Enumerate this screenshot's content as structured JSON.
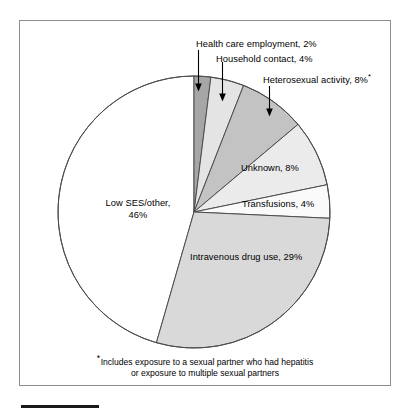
{
  "figure": {
    "frame_color": "#8d8d8d",
    "background": "#ffffff",
    "caption_rule_color": "#1a1a1a"
  },
  "footnote": {
    "marker": "*",
    "line1": "Includes exposure to a sexual partner who had hepatitis",
    "line2": "or exposure to multiple sexual partners"
  },
  "labels": {
    "health_care": "Health care employment, 2%",
    "household": "Household contact, 4%",
    "heterosexual": "Heterosexual activity, 8%",
    "heterosexual_marker": "*",
    "unknown": "Unknown, 8%",
    "transfusions": "Transfusions, 4%",
    "ivdu": "Intravenous drug use, 29%",
    "low_ses_line1": "Low SES/other,",
    "low_ses_line2": "46%"
  },
  "chart_data": {
    "type": "pie",
    "title": "",
    "start_angle_deg": 0,
    "direction": "clockwise",
    "center": {
      "x": 194,
      "y": 212
    },
    "radius": 136,
    "total_percent": 101,
    "slices": [
      {
        "label": "Health care employment",
        "value": 2,
        "display": "Health care employment, 2%",
        "color": "#a6a6a6",
        "leader": "arrow"
      },
      {
        "label": "Household contact",
        "value": 4,
        "display": "Household contact, 4%",
        "color": "#e4e4e4",
        "leader": "arrow"
      },
      {
        "label": "Heterosexual activity",
        "value": 8,
        "display": "Heterosexual activity, 8%*",
        "color": "#c3c3c3",
        "leader": "arrow"
      },
      {
        "label": "Unknown",
        "value": 8,
        "display": "Unknown, 8%",
        "color": "#ebebeb",
        "leader": "inside"
      },
      {
        "label": "Transfusions",
        "value": 4,
        "display": "Transfusions, 4%",
        "color": "#fafafa",
        "leader": "inside"
      },
      {
        "label": "Intravenous drug use",
        "value": 29,
        "display": "Intravenous drug use, 29%",
        "color": "#d9d9d9",
        "leader": "inside"
      },
      {
        "label": "Low SES/other",
        "value": 46,
        "display": "Low SES/other, 46%",
        "color": "#ffffff",
        "leader": "inside"
      }
    ],
    "slice_outline_color": "#4d4d4d",
    "legend": "none",
    "xlabel": "",
    "ylabel": ""
  }
}
